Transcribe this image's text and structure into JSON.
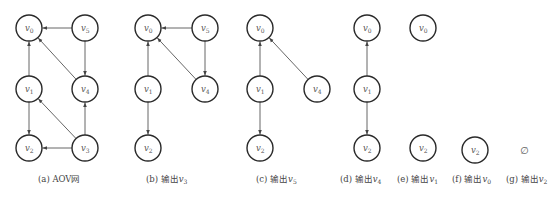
{
  "figure": {
    "node_radius": 13,
    "colors": {
      "node_stroke": "#2a2a2a",
      "edge": "#555555",
      "label": "#555555",
      "caption": "#444444"
    },
    "panels": [
      {
        "id": "a",
        "caption": {
          "prefix": "(a) ",
          "text": "AOV网",
          "var": "",
          "sub": ""
        },
        "nodes": [
          {
            "name": "v",
            "sub": "0",
            "x": 29,
            "y": 28
          },
          {
            "name": "v",
            "sub": "5",
            "x": 85,
            "y": 28
          },
          {
            "name": "v",
            "sub": "1",
            "x": 29,
            "y": 89
          },
          {
            "name": "v",
            "sub": "4",
            "x": 85,
            "y": 89
          },
          {
            "name": "v",
            "sub": "2",
            "x": 29,
            "y": 148
          },
          {
            "name": "v",
            "sub": "3",
            "x": 85,
            "y": 148
          }
        ],
        "edges": [
          [
            "5",
            "0"
          ],
          [
            "5",
            "4"
          ],
          [
            "1",
            "0"
          ],
          [
            "4",
            "0"
          ],
          [
            "1",
            "2"
          ],
          [
            "3",
            "1"
          ],
          [
            "3",
            "4"
          ],
          [
            "3",
            "2"
          ]
        ]
      },
      {
        "id": "b",
        "caption": {
          "prefix": "(b)  ",
          "text": "输出",
          "var": "v",
          "sub": "3"
        },
        "nodes": [
          {
            "name": "v",
            "sub": "0",
            "x": 148,
            "y": 28
          },
          {
            "name": "v",
            "sub": "5",
            "x": 205,
            "y": 28
          },
          {
            "name": "v",
            "sub": "1",
            "x": 148,
            "y": 89
          },
          {
            "name": "v",
            "sub": "4",
            "x": 205,
            "y": 89
          },
          {
            "name": "v",
            "sub": "2",
            "x": 148,
            "y": 148
          }
        ],
        "edges": [
          [
            "5",
            "0"
          ],
          [
            "5",
            "4"
          ],
          [
            "4",
            "0"
          ],
          [
            "1",
            "0"
          ],
          [
            "1",
            "2"
          ]
        ]
      },
      {
        "id": "c",
        "caption": {
          "prefix": "(c)  ",
          "text": "输出",
          "var": "v",
          "sub": "5"
        },
        "nodes": [
          {
            "name": "v",
            "sub": "0",
            "x": 260,
            "y": 28
          },
          {
            "name": "v",
            "sub": "1",
            "x": 260,
            "y": 89
          },
          {
            "name": "v",
            "sub": "4",
            "x": 317,
            "y": 89
          },
          {
            "name": "v",
            "sub": "2",
            "x": 260,
            "y": 148
          }
        ],
        "edges": [
          [
            "1",
            "0"
          ],
          [
            "4",
            "0"
          ],
          [
            "1",
            "2"
          ]
        ]
      },
      {
        "id": "d",
        "caption": {
          "prefix": "(d)  ",
          "text": "输出",
          "var": "v",
          "sub": "4"
        },
        "nodes": [
          {
            "name": "v",
            "sub": "0",
            "x": 367,
            "y": 28
          },
          {
            "name": "v",
            "sub": "1",
            "x": 367,
            "y": 89
          },
          {
            "name": "v",
            "sub": "2",
            "x": 367,
            "y": 148
          }
        ],
        "edges": [
          [
            "1",
            "0"
          ],
          [
            "1",
            "2"
          ]
        ]
      },
      {
        "id": "e",
        "caption": {
          "prefix": "(e)  ",
          "text": "输出",
          "var": "v",
          "sub": "1"
        },
        "nodes": [
          {
            "name": "v",
            "sub": "0",
            "x": 423,
            "y": 28
          },
          {
            "name": "v",
            "sub": "2",
            "x": 423,
            "y": 148
          }
        ],
        "edges": []
      },
      {
        "id": "f",
        "caption": {
          "prefix": "(f)  ",
          "text": "输出",
          "var": "v",
          "sub": "0"
        },
        "nodes": [
          {
            "name": "v",
            "sub": "2",
            "x": 475,
            "y": 150
          }
        ],
        "edges": []
      },
      {
        "id": "g",
        "caption": {
          "prefix": "(g)  ",
          "text": "输出",
          "var": "v",
          "sub": "2"
        },
        "nodes": [],
        "edges": [],
        "empty_symbol": "∅"
      }
    ],
    "caption_positions": {
      "a": 38,
      "b": 146,
      "c": 256,
      "d": 340,
      "e": 397,
      "f": 452,
      "g": 506
    },
    "empty_symbol_position": {
      "x": 520,
      "y": 145
    }
  }
}
